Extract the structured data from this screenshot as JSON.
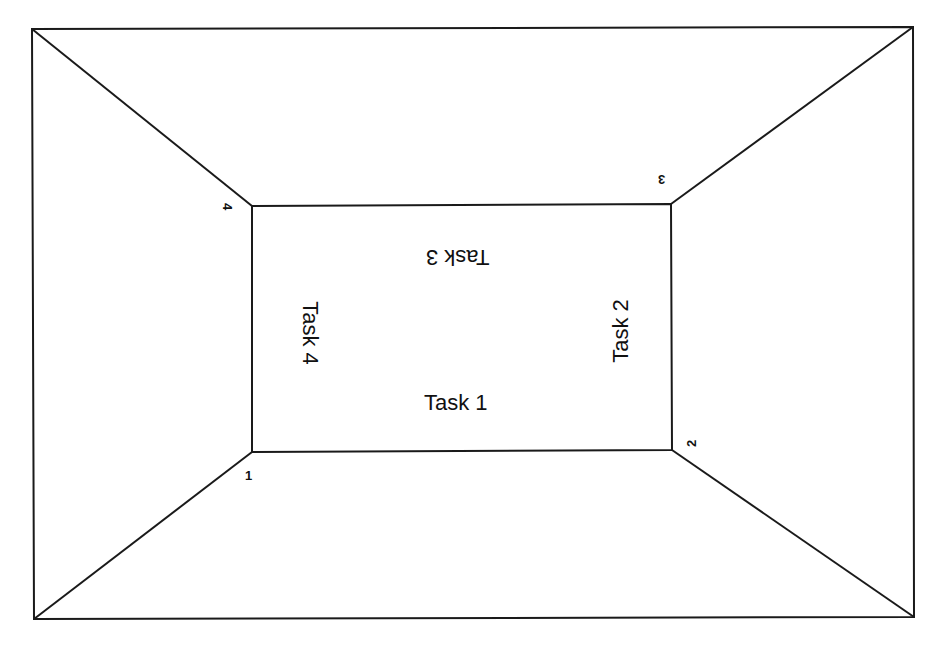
{
  "diagram": {
    "type": "room-layout",
    "line_color": "#1a1a1a",
    "background": "#ffffff",
    "tasks": [
      {
        "label": "Task 1",
        "side": "bottom",
        "orientation": "upright"
      },
      {
        "label": "Task 2",
        "side": "right",
        "orientation": "rotated-ccw"
      },
      {
        "label": "Task 3",
        "side": "top",
        "orientation": "upside-down"
      },
      {
        "label": "Task 4",
        "side": "left",
        "orientation": "rotated-cw"
      }
    ],
    "corners": [
      {
        "label": "1",
        "position": "bottom-left"
      },
      {
        "label": "2",
        "position": "bottom-right"
      },
      {
        "label": "3",
        "position": "top-right"
      },
      {
        "label": "4",
        "position": "top-left"
      }
    ]
  }
}
